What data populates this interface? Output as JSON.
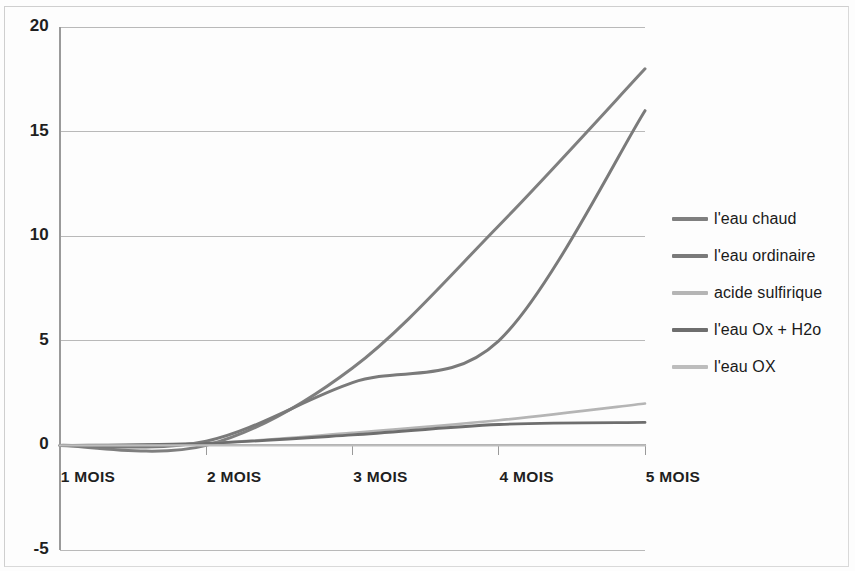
{
  "chart_data": {
    "type": "line",
    "title": "",
    "subtitle": "",
    "xlabel": "",
    "ylabel": "",
    "categories": [
      "1 MOIS",
      "2 MOIS",
      "3 MOIS",
      "4 MOIS",
      "5 MOIS"
    ],
    "ylim": [
      -5,
      20
    ],
    "yticks": [
      20,
      15,
      10,
      5,
      0,
      -5
    ],
    "ytick_labels": [
      "20",
      "15",
      "10",
      "5",
      "0",
      "-5"
    ],
    "grid": true,
    "grid_axis": "y",
    "legend_position": "right",
    "smoothed_lines": true,
    "markers": false,
    "series": [
      {
        "name": "l'eau chaud",
        "color": "#7f7f7f",
        "width": 3.0,
        "values": [
          0,
          0,
          3.7,
          10.5,
          18
        ]
      },
      {
        "name": "l'eau ordinaire",
        "color": "#7a7a7a",
        "width": 3.0,
        "values": [
          0,
          0.2,
          3.0,
          5.0,
          16
        ]
      },
      {
        "name": "acide sulfirique",
        "color": "#b5b5b5",
        "width": 2.6,
        "values": [
          0,
          0.1,
          0.6,
          1.2,
          2.0
        ]
      },
      {
        "name": "l'eau Ox + H2o",
        "color": "#6e6e6e",
        "width": 2.8,
        "values": [
          0,
          0.1,
          0.5,
          1.0,
          1.1
        ]
      },
      {
        "name": "l'eau OX",
        "color": "#bdbdbd",
        "width": 2.4,
        "values": [
          0,
          0,
          0,
          0,
          0
        ]
      }
    ]
  },
  "axes": {
    "plot_left": 60,
    "plot_right": 645,
    "plot_top": 27,
    "plot_bottom": 550,
    "y_zero_px": 444,
    "gridline_color": "#b9b9b9",
    "axis_color": "#9a9a9a"
  },
  "legend": {
    "entries": [
      {
        "label": "l'eau chaud",
        "color": "#7f7f7f"
      },
      {
        "label": "l'eau ordinaire",
        "color": "#7a7a7a"
      },
      {
        "label": "acide sulfirique",
        "color": "#b5b5b5"
      },
      {
        "label": "l'eau Ox + H2o",
        "color": "#6e6e6e"
      },
      {
        "label": "l'eau OX",
        "color": "#bdbdbd"
      }
    ]
  }
}
